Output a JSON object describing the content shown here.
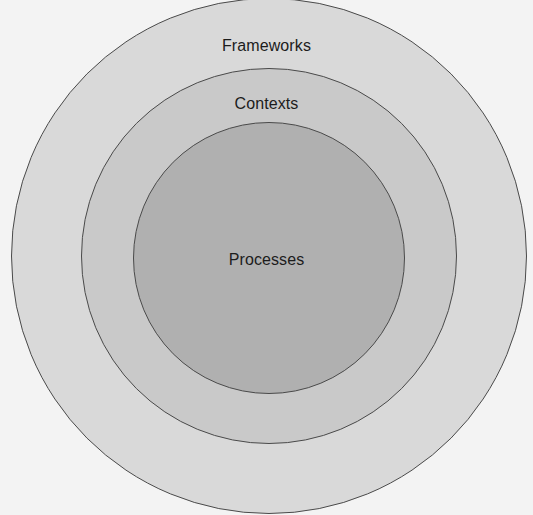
{
  "figure": {
    "type": "concentric-circles-venn",
    "background_color": "#f3f3f3",
    "stroke_color": "#4a4a4a"
  },
  "diagram_data": {
    "type": "nested-circles",
    "center": {
      "x": 269,
      "y": 256
    },
    "layers": [
      {
        "id": "frameworks",
        "label": "Frameworks",
        "level": 1,
        "position": "outer",
        "radius": 258,
        "fill": "#d9d9d9",
        "label_position": {
          "x": 269,
          "y": 46
        }
      },
      {
        "id": "contexts",
        "label": "Contexts",
        "level": 2,
        "position": "middle",
        "radius": 188,
        "fill": "#c9c9c9",
        "label_position": {
          "x": 269,
          "y": 104
        }
      },
      {
        "id": "processes",
        "label": "Processes",
        "level": 3,
        "position": "inner",
        "radius": 136,
        "fill": "#b0b0b0",
        "label_position": {
          "x": 269,
          "y": 260
        }
      }
    ]
  }
}
